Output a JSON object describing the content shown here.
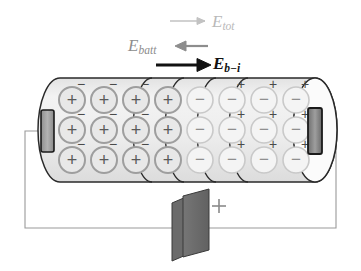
{
  "figure": {
    "background_color": "#ffffff"
  },
  "labels": {
    "e_tot": {
      "symbol": "E",
      "subscript": "tot",
      "color": "#b9b9b9",
      "arrow": "right-arrow-light"
    },
    "e_batt": {
      "symbol": "E",
      "subscript": "batt",
      "color": "#8d8d8d",
      "arrow": "left-arrow-gray"
    },
    "e_b_i": {
      "symbol": "E",
      "subscript": "b−i",
      "color": "#111111",
      "arrow": "right-arrow-black-bold"
    }
  },
  "battery": {
    "plate_color": "#6e6e6e",
    "plate_outline": "#3a3a3a",
    "polarity_label": "+",
    "polarity_color": "#8a8a8a"
  },
  "wire": {
    "color": "#9a9a9a"
  },
  "terminals": {
    "left": {
      "fill": "#9e9e9e",
      "outline": "#1a1a1a"
    },
    "right": {
      "fill": "#8a8a8a",
      "outline": "#1a1a1a"
    }
  },
  "cylinder": {
    "body_fill": "#efefef",
    "outline": "#2a2a2a",
    "divider_color": "#2a2a2a",
    "slice_dividers": 4,
    "rows": 3,
    "columns": 8
  },
  "charges": {
    "positive_symbol": "+",
    "negative_symbol": "−",
    "positive_circle_color": "#9e9e9e",
    "negative_circle_color": "#c9c9c9",
    "superscript_color": "#4a4a4a",
    "grid": [
      [
        "+",
        "+",
        "+",
        "+",
        "−",
        "−",
        "−",
        "−"
      ],
      [
        "+",
        "+",
        "+",
        "+",
        "−",
        "−",
        "−",
        "−"
      ],
      [
        "+",
        "+",
        "+",
        "+",
        "−",
        "−",
        "−",
        "−"
      ]
    ],
    "surface_marks": [
      [
        "−",
        "−",
        "−",
        "",
        "",
        "+",
        "+",
        "+"
      ],
      [
        "−",
        "−",
        "−",
        "",
        "",
        "+",
        "+",
        "+"
      ],
      [
        "−",
        "−",
        "−",
        "",
        "",
        "+",
        "+",
        "+"
      ]
    ]
  }
}
